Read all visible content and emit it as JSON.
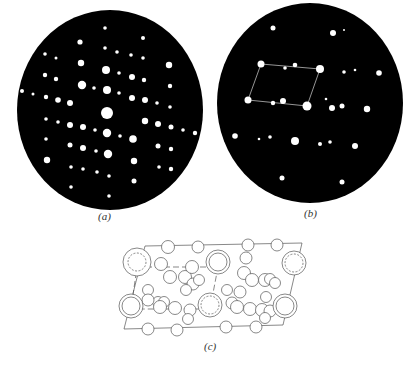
{
  "figure": {
    "panels": [
      {
        "id": "a",
        "label": "(a)",
        "kind": "diffraction-pattern",
        "disc": {
          "cx": 110,
          "cy": 110,
          "rx": 93,
          "ry": 100,
          "color": "#000000"
        },
        "spot_color": "#ffffff",
        "spots": [
          [
            105,
            28,
            1.8
          ],
          [
            80,
            42,
            2.6
          ],
          [
            143,
            38,
            2
          ],
          [
            45,
            54,
            1.8
          ],
          [
            56,
            58,
            1.5
          ],
          [
            105,
            48,
            1.8
          ],
          [
            117,
            52,
            1.8
          ],
          [
            131,
            55,
            1.8
          ],
          [
            143,
            58,
            1.8
          ],
          [
            81,
            63,
            3.2
          ],
          [
            106,
            70,
            4
          ],
          [
            169,
            65,
            3.2
          ],
          [
            45,
            75,
            2.2
          ],
          [
            56,
            79,
            2.2
          ],
          [
            119,
            73,
            1.8
          ],
          [
            132,
            77,
            3
          ],
          [
            144,
            80,
            2.2
          ],
          [
            82,
            85,
            4.2
          ],
          [
            94,
            88,
            1.8
          ],
          [
            107,
            90,
            4
          ],
          [
            119,
            93,
            1.8
          ],
          [
            170,
            86,
            2.2
          ],
          [
            22,
            91,
            2
          ],
          [
            33,
            94,
            1.5
          ],
          [
            46,
            97,
            2.2
          ],
          [
            58,
            100,
            2.8
          ],
          [
            70,
            103,
            3
          ],
          [
            132,
            98,
            3
          ],
          [
            145,
            100,
            3
          ],
          [
            157,
            103,
            1.8
          ],
          [
            170,
            107,
            1.8
          ],
          [
            107,
            113,
            6
          ],
          [
            46,
            119,
            1.8
          ],
          [
            58,
            122,
            1.8
          ],
          [
            70,
            125,
            3
          ],
          [
            83,
            127,
            3
          ],
          [
            95,
            130,
            1.8
          ],
          [
            145,
            121,
            3.2
          ],
          [
            158,
            124,
            3
          ],
          [
            171,
            127,
            2.5
          ],
          [
            183,
            130,
            1.8
          ],
          [
            195,
            133,
            2.2
          ],
          [
            107,
            133,
            4.2
          ],
          [
            120,
            136,
            1.8
          ],
          [
            133,
            139,
            3.8
          ],
          [
            46,
            139,
            1.8
          ],
          [
            70,
            145,
            2.5
          ],
          [
            83,
            148,
            3
          ],
          [
            96,
            151,
            1.8
          ],
          [
            108,
            154,
            4.2
          ],
          [
            158,
            146,
            2.5
          ],
          [
            171,
            149,
            2.2
          ],
          [
            47,
            160,
            3.2
          ],
          [
            134,
            161,
            3.2
          ],
          [
            71,
            167,
            1.8
          ],
          [
            83,
            169,
            1.8
          ],
          [
            97,
            172,
            1.8
          ],
          [
            109,
            176,
            1.8
          ],
          [
            159,
            167,
            1.8
          ],
          [
            171,
            169,
            2.2
          ],
          [
            134,
            181,
            2.5
          ],
          [
            71,
            187,
            1.8
          ],
          [
            109,
            196,
            1.8
          ]
        ]
      },
      {
        "id": "b",
        "label": "(b)",
        "kind": "diffraction-pattern",
        "disc": {
          "cx": 310,
          "cy": 103,
          "rx": 93,
          "ry": 100,
          "color": "#000000"
        },
        "spot_color": "#ffffff",
        "spots": [
          [
            273,
            28,
            2.5
          ],
          [
            333,
            33,
            3
          ],
          [
            344,
            30,
            1
          ],
          [
            261,
            64,
            3.5
          ],
          [
            285,
            68,
            1.8
          ],
          [
            295,
            65,
            2.3
          ],
          [
            320,
            69,
            4
          ],
          [
            344,
            72,
            1.8
          ],
          [
            355,
            70,
            1.3
          ],
          [
            379,
            73,
            2.8
          ],
          [
            248,
            100,
            3.5
          ],
          [
            273,
            103,
            2.2
          ],
          [
            283,
            101,
            3
          ],
          [
            326,
            99,
            1.3
          ],
          [
            307,
            106,
            4.5
          ],
          [
            332,
            108,
            3
          ],
          [
            342,
            106,
            2.5
          ],
          [
            367,
            109,
            3.2
          ],
          [
            235,
            136,
            2.8
          ],
          [
            259,
            139,
            1.3
          ],
          [
            270,
            137,
            1.8
          ],
          [
            295,
            141,
            4
          ],
          [
            320,
            144,
            2
          ],
          [
            330,
            142,
            1.8
          ],
          [
            355,
            146,
            3
          ],
          [
            282,
            178,
            2.5
          ],
          [
            342,
            182,
            2.5
          ]
        ],
        "unit_cell": [
          [
            261,
            64
          ],
          [
            320,
            69
          ],
          [
            307,
            106
          ],
          [
            248,
            100
          ]
        ],
        "unit_cell_color": "#bbbbbb"
      },
      {
        "id": "c",
        "label": "(c)",
        "kind": "crystal-structure-projection",
        "line_color": "#555555",
        "outer_cell": [
          [
            145,
            246
          ],
          [
            302,
            243
          ],
          [
            283,
            325
          ],
          [
            124,
            329
          ]
        ],
        "inner_cell_dashed": [
          [
            137,
            267
          ],
          [
            218,
            267
          ],
          [
            210,
            309
          ],
          [
            131,
            309
          ]
        ],
        "big_double_circles": [
          [
            137,
            262,
            14,
            9,
            true
          ],
          [
            218,
            262,
            12,
            9,
            false
          ],
          [
            131,
            306,
            12,
            9,
            false
          ],
          [
            210,
            305,
            12,
            9,
            true
          ],
          [
            294,
            263,
            12,
            9,
            true
          ],
          [
            285,
            306,
            12,
            9,
            false
          ]
        ],
        "atoms": [
          [
            168,
            247,
            6.5
          ],
          [
            198,
            247,
            6
          ],
          [
            248,
            245,
            6
          ],
          [
            277,
            245,
            6
          ],
          [
            161,
            264,
            6.5
          ],
          [
            170,
            277,
            6.5
          ],
          [
            185,
            277,
            6.5
          ],
          [
            192,
            267,
            6.5
          ],
          [
            193,
            284,
            6
          ],
          [
            199,
            280,
            5.5
          ],
          [
            246,
            258,
            6
          ],
          [
            244,
            273,
            6.5
          ],
          [
            252,
            280,
            6.5
          ],
          [
            265,
            280,
            6.5
          ],
          [
            270,
            279,
            5.5
          ],
          [
            275,
            283,
            5.5
          ],
          [
            158,
            302,
            5.5
          ],
          [
            164,
            302,
            5.5
          ],
          [
            186,
            290,
            5.5
          ],
          [
            240,
            292,
            6
          ],
          [
            266,
            297,
            5.5
          ],
          [
            148,
            290,
            5.5
          ],
          [
            148,
            300,
            6
          ],
          [
            160,
            307,
            6.5
          ],
          [
            175,
            308,
            6.5
          ],
          [
            190,
            310,
            6
          ],
          [
            188,
            319,
            5.5
          ],
          [
            227,
            290,
            5.5
          ],
          [
            232,
            303,
            6
          ],
          [
            237,
            307,
            6.5
          ],
          [
            250,
            309,
            6.5
          ],
          [
            262,
            310,
            6.5
          ],
          [
            270,
            311,
            6
          ],
          [
            265,
            318,
            5.5
          ],
          [
            148,
            329,
            6
          ],
          [
            177,
            330,
            6
          ],
          [
            226,
            327,
            6
          ],
          [
            256,
            327,
            6
          ]
        ]
      }
    ]
  }
}
